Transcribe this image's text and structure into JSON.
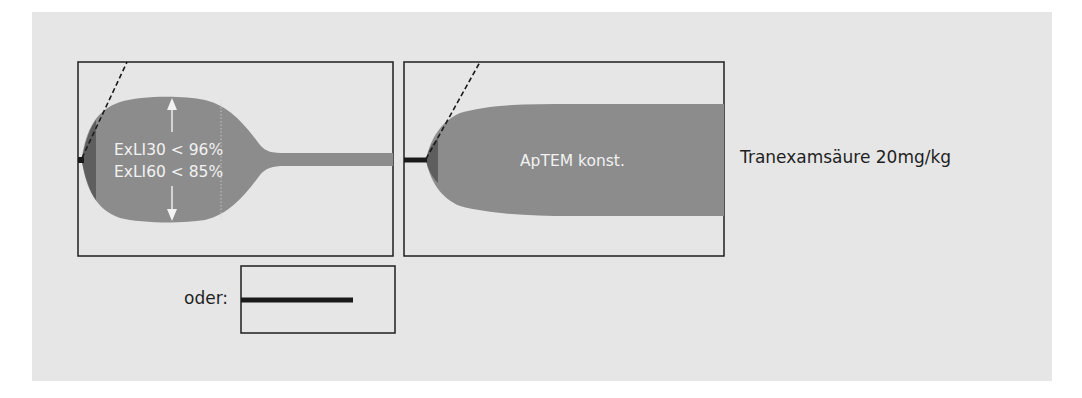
{
  "figure": {
    "panels": [
      {
        "id": "panel-lysis",
        "label_lines": [
          "ExLI30 < 96%",
          "ExLI60 < 85%"
        ],
        "description": "clot with lysis – amplitude drops after maximum"
      },
      {
        "id": "panel-aptem",
        "label": "ApTEM konst.",
        "description": "clot with constant amplitude"
      }
    ],
    "alternative_label": "oder:",
    "alternative_description": "flat line (no clot formation)",
    "treatment_label": "Tranexamsäure 20mg/kg"
  },
  "colors": {
    "paper": "#e6e6e6",
    "trace_fill": "#8c8c8c",
    "trace_dark": "#5e5e5e",
    "line": "#1a1a1a",
    "text_on_trace": "#f2f2f2"
  }
}
